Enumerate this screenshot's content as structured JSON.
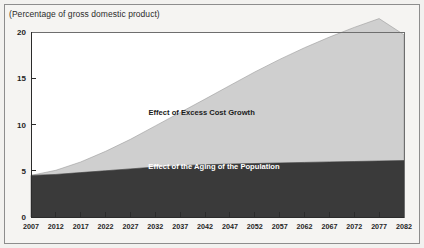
{
  "figure": {
    "units_note": "(Percentage of gross domestic product)",
    "background_color": "#f5f4f2",
    "border_color": "#8d8d8d"
  },
  "chart_data": {
    "type": "area",
    "stacked": true,
    "title": "",
    "subtitle": "",
    "xlabel": "",
    "ylabel": "",
    "units_note": "(Percentage of gross domestic product)",
    "xlim": [
      2007,
      2082
    ],
    "ylim": [
      0,
      20
    ],
    "yticks": [
      0,
      5,
      10,
      15,
      20
    ],
    "ytick_labels": [
      "0",
      "5",
      "10",
      "15",
      "20"
    ],
    "grid": false,
    "legend_position": "inline-annotations",
    "categories": [
      2007,
      2012,
      2017,
      2022,
      2027,
      2032,
      2037,
      2042,
      2047,
      2052,
      2057,
      2062,
      2067,
      2072,
      2077,
      2082
    ],
    "xtick_labels": [
      "2007",
      "2012",
      "2017",
      "2022",
      "2027",
      "2032",
      "2037",
      "2042",
      "2047",
      "2052",
      "2057",
      "2062",
      "2067",
      "2072",
      "2077",
      "2082"
    ],
    "series": [
      {
        "name": "Effect of the Aging of the Population",
        "color": "#3a3a3a",
        "label_color": "#ffffff",
        "values": [
          4.5,
          4.6,
          4.8,
          5.0,
          5.2,
          5.4,
          5.55,
          5.65,
          5.72,
          5.78,
          5.84,
          5.9,
          5.95,
          6.0,
          6.05,
          6.1
        ]
      },
      {
        "name": "Effect of Excess Cost Growth",
        "color": "#cfcfcf",
        "label_color": "#1b1b1b",
        "values": [
          0.0,
          0.45,
          1.15,
          2.1,
          3.2,
          4.45,
          5.75,
          7.1,
          8.5,
          9.9,
          11.2,
          12.4,
          13.5,
          14.5,
          15.4,
          13.6
        ]
      }
    ],
    "total_top": [
      4.5,
      5.05,
      5.95,
      7.1,
      8.4,
      9.85,
      11.3,
      12.75,
      14.22,
      15.68,
      17.04,
      18.3,
      19.45,
      20.5,
      21.45,
      19.7
    ],
    "annotations": [
      {
        "text": "Effect of Excess Cost Growth",
        "x": 2052,
        "y": 11.0
      },
      {
        "text": "Effect of the Aging of the Population",
        "x": 2057,
        "y": 5.2
      }
    ]
  }
}
